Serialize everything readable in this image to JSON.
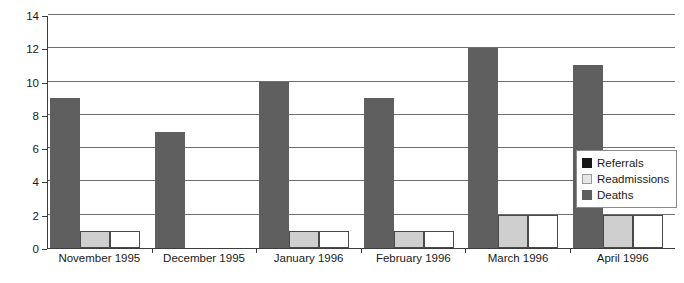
{
  "chart_data": {
    "type": "bar",
    "title": "",
    "subtitle": "",
    "xlabel": "",
    "ylabel": "",
    "ylim": [
      0,
      14
    ],
    "ytick_step": 2,
    "yticks": [
      0,
      2,
      4,
      6,
      8,
      10,
      12,
      14
    ],
    "ytick_labels": [
      "0",
      "2",
      "4",
      "6",
      "8",
      "10",
      "12",
      "14"
    ],
    "grid": "horizontal",
    "legend_position": "right-inside",
    "categories": [
      "November 1995",
      "December 1995",
      "January 1996",
      "February 1996",
      "March 1996",
      "April 1996"
    ],
    "series": [
      {
        "name": "Deaths",
        "color": "#5f5f5f",
        "values": [
          9,
          7,
          10,
          9,
          12,
          11
        ]
      },
      {
        "name": "Readmissions",
        "color": "#cfcfcf",
        "values": [
          1,
          0,
          1,
          1,
          2,
          2
        ]
      },
      {
        "name": "Referrals",
        "color": "#ffffff",
        "values": [
          1,
          0,
          1,
          1,
          2,
          2
        ]
      }
    ],
    "bar_draw_order": [
      "Deaths",
      "Readmissions",
      "Referrals"
    ]
  },
  "legend": {
    "items": [
      {
        "label": "Referrals",
        "swatch": "referrals"
      },
      {
        "label": "Readmissions",
        "swatch": "readmissions"
      },
      {
        "label": "Deaths",
        "swatch": "deaths"
      }
    ]
  },
  "colors": {
    "deaths": "#5f5f5f",
    "readmissions": "#cfcfcf",
    "referrals": "#ffffff",
    "legend_referrals_swatch": "#171717",
    "axis": "#3c3c3c",
    "gridline": "#6e6e6e",
    "text": "#1a1a1a",
    "background": "#ffffff"
  }
}
